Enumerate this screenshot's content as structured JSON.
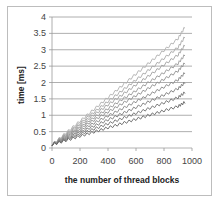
{
  "chart_data": {
    "type": "line",
    "title": "",
    "xlabel": "the number of thread blocks",
    "ylabel": "time [ms]",
    "xlim": [
      0,
      1000
    ],
    "ylim": [
      0,
      4
    ],
    "x_ticks": [
      0,
      200,
      400,
      600,
      800,
      1000
    ],
    "y_ticks": [
      0,
      0.5,
      1,
      1.5,
      2,
      2.5,
      3,
      3.5,
      4
    ],
    "grid": "horizontal",
    "legend": "none",
    "x": [
      0,
      100,
      200,
      300,
      400,
      500,
      600,
      700,
      800,
      900,
      950
    ],
    "series": [
      {
        "name": "s1",
        "color": "#b0b0b0",
        "values": [
          0.1,
          0.46,
          0.82,
          1.18,
          1.54,
          1.9,
          2.26,
          2.62,
          2.98,
          3.34,
          3.7
        ]
      },
      {
        "name": "s2",
        "color": "#a8a8a8",
        "values": [
          0.1,
          0.43,
          0.76,
          1.09,
          1.42,
          1.75,
          2.08,
          2.41,
          2.74,
          3.07,
          3.4
        ]
      },
      {
        "name": "s3",
        "color": "#a0a0a0",
        "values": [
          0.1,
          0.4,
          0.71,
          1.01,
          1.32,
          1.62,
          1.93,
          2.23,
          2.54,
          2.84,
          3.15
        ]
      },
      {
        "name": "s4",
        "color": "#989898",
        "values": [
          0.1,
          0.38,
          0.65,
          0.93,
          1.2,
          1.48,
          1.75,
          2.03,
          2.3,
          2.58,
          2.85
        ]
      },
      {
        "name": "s5",
        "color": "#909090",
        "values": [
          0.1,
          0.35,
          0.6,
          0.85,
          1.1,
          1.35,
          1.6,
          1.85,
          2.1,
          2.35,
          2.6
        ]
      },
      {
        "name": "s6",
        "color": "#888888",
        "values": [
          0.1,
          0.32,
          0.54,
          0.76,
          0.98,
          1.2,
          1.42,
          1.64,
          1.86,
          2.08,
          2.3
        ]
      },
      {
        "name": "s7",
        "color": "#7c7c7c",
        "values": [
          0.1,
          0.29,
          0.48,
          0.67,
          0.86,
          1.05,
          1.24,
          1.43,
          1.62,
          1.81,
          2.0
        ]
      },
      {
        "name": "s8",
        "color": "#707070",
        "values": [
          0.1,
          0.26,
          0.42,
          0.58,
          0.74,
          0.9,
          1.06,
          1.22,
          1.38,
          1.54,
          1.7
        ]
      },
      {
        "name": "s9",
        "color": "#646464",
        "values": [
          0.1,
          0.23,
          0.36,
          0.49,
          0.62,
          0.75,
          0.88,
          1.01,
          1.14,
          1.27,
          1.4
        ]
      }
    ]
  }
}
